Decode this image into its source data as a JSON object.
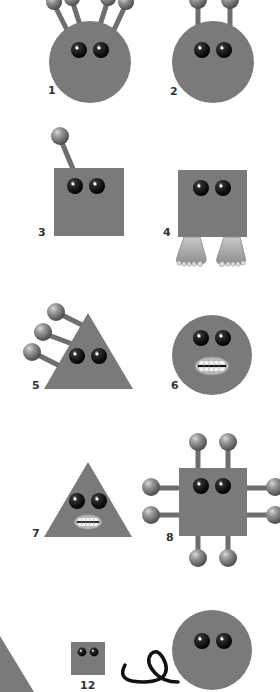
{
  "figure": {
    "body_color": "#7a7a7a",
    "ball_color": "#8a8a8a",
    "eye_color": "#111111",
    "characters": [
      {
        "id": "1",
        "label": "1",
        "shape": "circle",
        "features": "four angled antennae with ball tips"
      },
      {
        "id": "2",
        "label": "2",
        "shape": "circle",
        "features": "two straight antennae with ball tips"
      },
      {
        "id": "3",
        "label": "3",
        "shape": "square",
        "features": "one angled antenna with ball tip"
      },
      {
        "id": "4",
        "label": "4",
        "shape": "square",
        "features": "two bare feet"
      },
      {
        "id": "5",
        "label": "5",
        "shape": "triangle",
        "features": "three side antennae with ball tips"
      },
      {
        "id": "6",
        "label": "6",
        "shape": "circle",
        "features": "grimacing mouth with teeth"
      },
      {
        "id": "7",
        "label": "7",
        "shape": "triangle",
        "features": "grimacing mouth with teeth"
      },
      {
        "id": "8",
        "label": "8",
        "shape": "square",
        "features": "eight antennae with ball tips on all sides"
      },
      {
        "id": "12",
        "label": "12",
        "shape": "small square",
        "features": "tiny body"
      },
      {
        "id": "tail-circle",
        "label": "",
        "shape": "circle",
        "features": "curly tail"
      }
    ]
  }
}
